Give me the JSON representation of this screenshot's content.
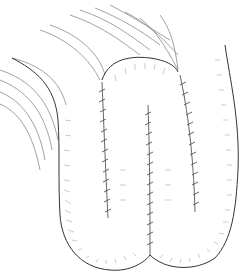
{
  "figure": {
    "title": "",
    "colors": {
      "background": "#ffffff",
      "outline": "#333333",
      "hatch": "#9a9a9a",
      "suture": "#555555"
    },
    "elements": [
      "mesentery-strands",
      "bowel-loop-left",
      "bowel-loop-middle",
      "bowel-loop-right",
      "suture-line-1",
      "suture-line-2",
      "suture-line-3"
    ]
  }
}
